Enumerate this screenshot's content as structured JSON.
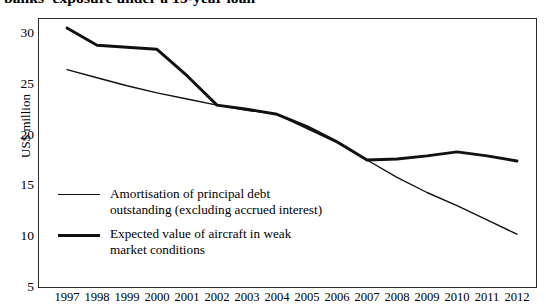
{
  "title": "banks' exposure under a 15-year loan",
  "axes": {
    "y_title": "US$ million",
    "y_ticks": [
      "30",
      "25",
      "20",
      "15",
      "10",
      "5"
    ],
    "x_ticks": [
      "1997",
      "1998",
      "1999",
      "2000",
      "2001",
      "2002",
      "2003",
      "2004",
      "2005",
      "2006",
      "2007",
      "2008",
      "2009",
      "2010",
      "2011",
      "2012"
    ]
  },
  "legend": {
    "entries": [
      {
        "label": "Amortisation of principal debt\noutstanding (excluding accrued interest)",
        "style": "thin"
      },
      {
        "label": "Expected value of aircraft in weak\nmarket conditions",
        "style": "thick"
      }
    ]
  },
  "colors": {
    "line": "#111111",
    "frame": "#2b2b2b",
    "background": "#ffffff"
  },
  "chart_data": {
    "type": "line",
    "title": "banks' exposure under a 15-year loan",
    "xlabel": "",
    "ylabel": "US$ million",
    "ylim": [
      5,
      30
    ],
    "grid": false,
    "legend_position": "inside-lower-left",
    "categories": [
      "1997",
      "1998",
      "1999",
      "2000",
      "2001",
      "2002",
      "2003",
      "2004",
      "2005",
      "2006",
      "2007",
      "2008",
      "2009",
      "2010",
      "2011",
      "2012"
    ],
    "series": [
      {
        "name": "Expected value of aircraft in weak market conditions",
        "style": "thick",
        "values": [
          30.5,
          28.8,
          28.6,
          28.4,
          25.8,
          22.9,
          22.5,
          22.0,
          20.8,
          19.3,
          17.5,
          17.6,
          17.9,
          18.3,
          17.9,
          17.4
        ]
      },
      {
        "name": "Amortisation of principal debt outstanding (excluding accrued interest)",
        "style": "thin",
        "values": [
          26.4,
          25.6,
          24.8,
          24.1,
          23.5,
          22.9,
          22.4,
          22.0,
          20.6,
          19.2,
          17.5,
          15.8,
          14.3,
          13.0,
          11.6,
          10.2
        ]
      }
    ]
  }
}
